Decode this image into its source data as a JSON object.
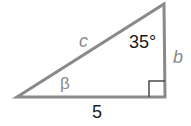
{
  "diagram": {
    "type": "right-triangle",
    "colors": {
      "stroke": "#8a8a8a",
      "label_gray": "#8a8a8a",
      "label_black": "#1a1a1a",
      "background": "#ffffff"
    },
    "vertices": {
      "left": [
        17,
        97
      ],
      "right_angle": [
        165,
        97
      ],
      "top": [
        164,
        4
      ]
    },
    "labels": {
      "hypotenuse": "c",
      "top_angle": "35°",
      "vertical_side": "b",
      "bottom_left_angle": "β",
      "base": "5"
    }
  }
}
